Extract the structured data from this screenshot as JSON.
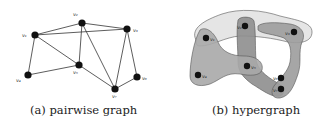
{
  "panels": [
    {
      "id": "a",
      "caption": "(a) pairwise graph",
      "nodes": [
        {
          "id": "v1",
          "label": "v₁",
          "x": 35,
          "y": 35,
          "lx": 23,
          "ly": 36
        },
        {
          "id": "v2",
          "label": "v₂",
          "x": 82,
          "y": 23,
          "lx": 73,
          "ly": 16
        },
        {
          "id": "v3",
          "label": "v₃",
          "x": 127,
          "y": 29,
          "lx": 133,
          "ly": 32
        },
        {
          "id": "v4",
          "label": "v₄",
          "x": 28,
          "y": 75,
          "lx": 17,
          "ly": 82
        },
        {
          "id": "v5",
          "label": "v₅",
          "x": 79,
          "y": 65,
          "lx": 73,
          "ly": 74
        },
        {
          "id": "v6",
          "label": "v₆",
          "x": 137,
          "y": 77,
          "lx": 143,
          "ly": 80
        },
        {
          "id": "v7",
          "label": "v₇",
          "x": 115,
          "y": 89,
          "lx": 113,
          "ly": 98
        }
      ],
      "edges": [
        [
          "v1",
          "v2"
        ],
        [
          "v1",
          "v3"
        ],
        [
          "v2",
          "v3"
        ],
        [
          "v1",
          "v4"
        ],
        [
          "v1",
          "v5"
        ],
        [
          "v4",
          "v5"
        ],
        [
          "v2",
          "v5"
        ],
        [
          "v5",
          "v7"
        ],
        [
          "v2",
          "v7"
        ],
        [
          "v3",
          "v7"
        ],
        [
          "v3",
          "v6"
        ],
        [
          "v6",
          "v7"
        ]
      ]
    },
    {
      "id": "b",
      "caption": "(b) hypergraph",
      "nodes": [
        {
          "id": "v1",
          "label": "v₁",
          "x": 206,
          "y": 38
        },
        {
          "id": "v2",
          "label": "v₂",
          "x": 245,
          "y": 26
        },
        {
          "id": "v3",
          "label": "v₃",
          "x": 294,
          "y": 32
        },
        {
          "id": "v4",
          "label": "v₄",
          "x": 198,
          "y": 75
        },
        {
          "id": "v5",
          "label": "v₅",
          "x": 247,
          "y": 66
        },
        {
          "id": "v6",
          "label": "v₆",
          "x": 281,
          "y": 78
        },
        {
          "id": "v7",
          "label": "v₇",
          "x": 281,
          "y": 89
        }
      ],
      "hyperedges": [
        {
          "name": "e-v1-v2-v3",
          "members": [
            "v1",
            "v2",
            "v3"
          ],
          "fill": "#e4e4e4"
        },
        {
          "name": "e-v1-v4-v5",
          "members": [
            "v1",
            "v4",
            "v5"
          ],
          "fill": "#a9a9a9"
        },
        {
          "name": "e-v2-v5-v7",
          "members": [
            "v2",
            "v5",
            "v7"
          ],
          "fill": "#8e8e8e"
        },
        {
          "name": "e-v3-v6-v7",
          "members": [
            "v3",
            "v6",
            "v7"
          ],
          "fill": "#9c9c9c"
        }
      ]
    }
  ],
  "colors": {
    "node": "#111111",
    "edge": "#333333",
    "background": "#ffffff"
  }
}
